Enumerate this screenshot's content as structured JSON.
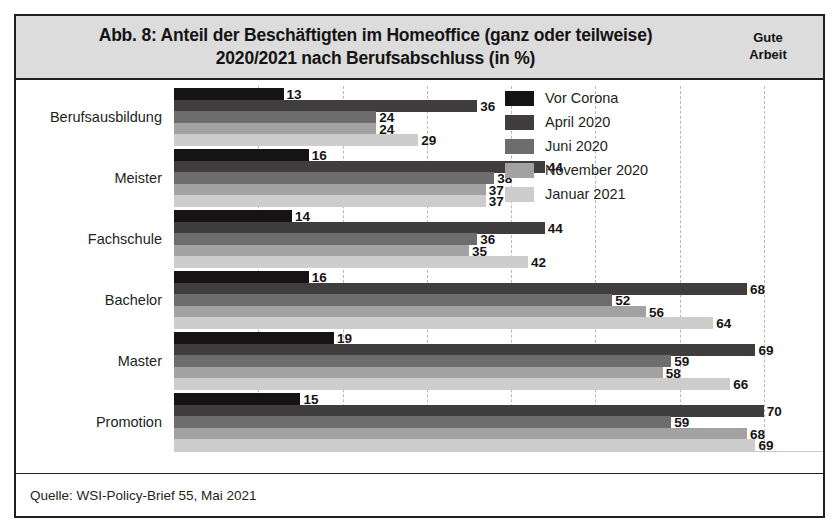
{
  "header": {
    "title_line1": "Abb. 8: Anteil der Beschäftigten im Homeoffice (ganz oder teilweise)",
    "title_line2": "2020/2021 nach Berufsabschluss (in %)",
    "brand_line1": "Gute",
    "brand_line2": "Arbeit"
  },
  "footer": {
    "source": "Quelle: WSI-Policy-Brief 55, Mai 2021"
  },
  "chart_data": {
    "type": "bar",
    "orientation": "horizontal",
    "title": "Abb. 8: Anteil der Beschäftigten im Homeoffice (ganz oder teilweise) 2020/2021 nach Berufsabschluss (in %)",
    "xlabel": "",
    "ylabel": "",
    "xlim": [
      0,
      75
    ],
    "grid": true,
    "grid_step": 10,
    "legend_position": "top-right",
    "categories": [
      "Berufsausbildung",
      "Meister",
      "Fachschule",
      "Bachelor",
      "Master",
      "Promotion"
    ],
    "series": [
      {
        "name": "Vor Corona",
        "color": "#151314",
        "values": [
          13,
          16,
          14,
          16,
          19,
          15
        ]
      },
      {
        "name": "April 2020",
        "color": "#3f3d3e",
        "values": [
          36,
          44,
          44,
          68,
          69,
          70
        ]
      },
      {
        "name": "Juni 2020",
        "color": "#6e6d6e",
        "values": [
          24,
          38,
          36,
          52,
          59,
          59
        ]
      },
      {
        "name": "November 2020",
        "color": "#a3a2a3",
        "values": [
          24,
          37,
          35,
          56,
          58,
          68
        ]
      },
      {
        "name": "Januar 2021",
        "color": "#cdcdcd",
        "values": [
          29,
          37,
          42,
          64,
          66,
          69
        ]
      }
    ]
  }
}
